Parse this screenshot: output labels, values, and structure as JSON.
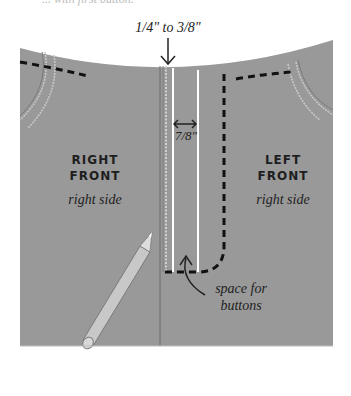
{
  "top_caption": "... with first button.",
  "measurements": {
    "seam_allowance": "1/4\" to 3/8\"",
    "placket_width": "7/8\""
  },
  "panels": {
    "right_front": {
      "title_line1": "RIGHT",
      "title_line2": "FRONT",
      "subtitle": "right side"
    },
    "left_front": {
      "title_line1": "LEFT",
      "title_line2": "FRONT",
      "subtitle": "right side"
    }
  },
  "annotations": {
    "space_for_buttons_line1": "space for",
    "space_for_buttons_line2": "buttons"
  },
  "colors": {
    "fabric": "#999999",
    "dashed_line": "#111111",
    "white_line": "#ffffff",
    "pencil": "#c8c8c8"
  }
}
